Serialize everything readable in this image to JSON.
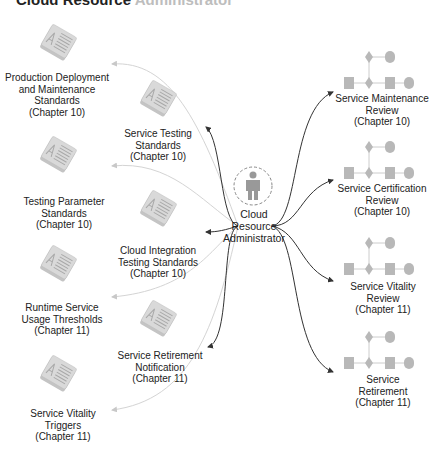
{
  "title": {
    "bold": "Cloud Resource",
    "faded": "Administrator"
  },
  "colors": {
    "dark_arrow": "#333333",
    "light_arrow": "#cfcfcf",
    "shape_fill": "#b9b9b9",
    "doc_fill": "#d6d6d6"
  },
  "center": {
    "icon": "person-icon",
    "label_lines": [
      "Cloud",
      "Resource",
      "Administrator"
    ]
  },
  "documents": [
    {
      "icon": "document-stack-icon",
      "lines": [
        "Production Deployment",
        "and Maintenance",
        "Standards",
        "(Chapter 10)"
      ]
    },
    {
      "icon": "document-stack-icon",
      "lines": [
        "Service Testing",
        "Standards",
        "(Chapter 10)"
      ]
    },
    {
      "icon": "document-stack-icon",
      "lines": [
        "Testing Parameter",
        "Standards",
        "(Chapter 10)"
      ]
    },
    {
      "icon": "document-stack-icon",
      "lines": [
        "Cloud Integration",
        "Testing Standards",
        "(Chapter 10)"
      ]
    },
    {
      "icon": "document-stack-icon",
      "lines": [
        "Runtime Service",
        "Usage Thresholds",
        "(Chapter 11)"
      ]
    },
    {
      "icon": "document-stack-icon",
      "lines": [
        "Service Retirement",
        "Notification",
        "(Chapter 11)"
      ]
    },
    {
      "icon": "document-stack-icon",
      "lines": [
        "Service Vitality",
        "Triggers",
        "(Chapter 11)"
      ]
    }
  ],
  "processes": [
    {
      "icon": "workflow-icon",
      "lines": [
        "Service Maintenance",
        "Review",
        "(Chapter 10)"
      ]
    },
    {
      "icon": "workflow-icon",
      "lines": [
        "Service Certification",
        "Review",
        "(Chapter 10)"
      ]
    },
    {
      "icon": "workflow-icon",
      "lines": [
        "Service Vitality",
        "Review",
        "(Chapter 11)"
      ]
    },
    {
      "icon": "workflow-icon",
      "lines": [
        "Service",
        "Retirement",
        "(Chapter 11)"
      ]
    }
  ]
}
